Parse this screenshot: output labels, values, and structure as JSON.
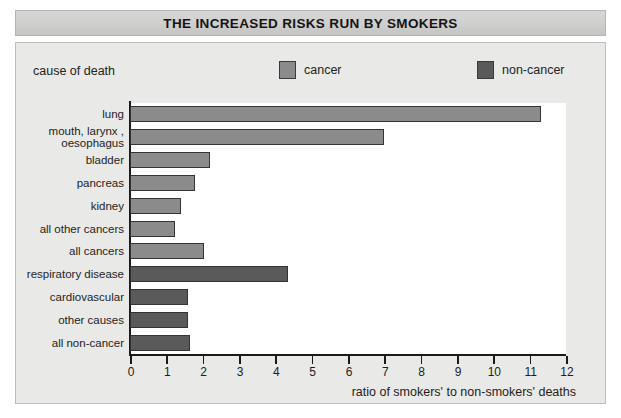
{
  "title": "THE INCREASED RISKS RUN BY SMOKERS",
  "legend": {
    "caption": "cause of death",
    "items": [
      {
        "label": "cancer",
        "color": "#8b8b8b"
      },
      {
        "label": "non-cancer",
        "color": "#5a5a5a"
      }
    ]
  },
  "chart_data": {
    "type": "bar",
    "orientation": "horizontal",
    "title": "THE INCREASED RISKS RUN BY SMOKERS",
    "xlabel": "ratio of smokers' to non-smokers' deaths",
    "ylabel": "cause of death",
    "xlim": [
      0,
      12
    ],
    "xticks": [
      0,
      1,
      2,
      3,
      4,
      5,
      6,
      7,
      8,
      9,
      10,
      11,
      12
    ],
    "xtick_labels": [
      "0",
      "1",
      "2",
      "3",
      "4",
      "5",
      "6",
      "7",
      "8",
      "9",
      "10",
      "11",
      "12"
    ],
    "grid": false,
    "legend_position": "top",
    "categories": [
      "lung",
      "mouth, larynx ,\noesophagus",
      "bladder",
      "pancreas",
      "kidney",
      "all other cancers",
      "all cancers",
      "respiratory disease",
      "cardiovascular",
      "other causes",
      "all non-cancer"
    ],
    "values": [
      11.3,
      7.0,
      2.2,
      1.8,
      1.4,
      1.25,
      2.05,
      4.35,
      1.6,
      1.6,
      1.65
    ],
    "groups": [
      "cancer",
      "cancer",
      "cancer",
      "cancer",
      "cancer",
      "cancer",
      "cancer",
      "non-cancer",
      "non-cancer",
      "non-cancer",
      "non-cancer"
    ],
    "series": [
      {
        "name": "cancer",
        "color": "#8b8b8b",
        "points": [
          {
            "category": "lung",
            "value": 11.3
          },
          {
            "category": "mouth, larynx , oesophagus",
            "value": 7.0
          },
          {
            "category": "bladder",
            "value": 2.2
          },
          {
            "category": "pancreas",
            "value": 1.8
          },
          {
            "category": "kidney",
            "value": 1.4
          },
          {
            "category": "all other cancers",
            "value": 1.25
          },
          {
            "category": "all cancers",
            "value": 2.05
          }
        ]
      },
      {
        "name": "non-cancer",
        "color": "#5a5a5a",
        "points": [
          {
            "category": "respiratory disease",
            "value": 4.35
          },
          {
            "category": "cardiovascular",
            "value": 1.6
          },
          {
            "category": "other causes",
            "value": 1.6
          },
          {
            "category": "all non-cancer",
            "value": 1.65
          }
        ]
      }
    ]
  }
}
